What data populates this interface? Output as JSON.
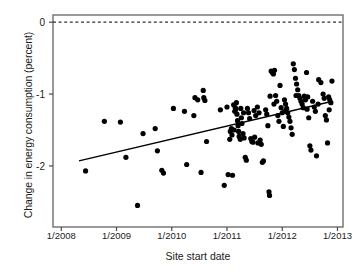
{
  "chart_data": {
    "type": "scatter",
    "title": "",
    "xlabel": "Site start date",
    "ylabel": "Change in energy consumption (percent)",
    "xtick_labels": [
      "1/2008",
      "1/2009",
      "1/2010",
      "1/2011",
      "1/2012",
      "1/2013"
    ],
    "xtick_values": [
      2008.0,
      2009.0,
      2010.0,
      2011.0,
      2012.0,
      2013.0
    ],
    "ytick_labels": [
      "0",
      "-1",
      "-2"
    ],
    "ytick_values": [
      0,
      -1,
      -2
    ],
    "xlim": [
      2007.85,
      2013.1
    ],
    "ylim": [
      -2.85,
      0.1
    ],
    "grid": false,
    "legend": null,
    "marker_color": "#000000",
    "marker_size_px": 4.6,
    "reference_line": {
      "y": 0,
      "style": "dashed",
      "color": "#333333"
    },
    "trendline": {
      "type": "linear-fit",
      "color": "#000000",
      "x_start": 2008.32,
      "y_start": -1.93,
      "x_end": 2012.91,
      "y_end": -1.1
    },
    "points": [
      [
        2008.44,
        -2.07
      ],
      [
        2008.78,
        -1.38
      ],
      [
        2009.07,
        -1.39
      ],
      [
        2009.17,
        -1.88
      ],
      [
        2009.38,
        -2.55
      ],
      [
        2009.48,
        -1.55
      ],
      [
        2009.7,
        -1.48
      ],
      [
        2009.74,
        -1.79
      ],
      [
        2009.82,
        -2.06
      ],
      [
        2009.85,
        -2.1
      ],
      [
        2010.03,
        -1.2
      ],
      [
        2010.23,
        -1.24
      ],
      [
        2010.27,
        -1.98
      ],
      [
        2010.4,
        -1.3
      ],
      [
        2010.42,
        -1.05
      ],
      [
        2010.47,
        -1.08
      ],
      [
        2010.53,
        -2.09
      ],
      [
        2010.57,
        -0.95
      ],
      [
        2010.58,
        -1.05
      ],
      [
        2010.6,
        -1.09
      ],
      [
        2010.63,
        -1.66
      ],
      [
        2010.88,
        -1.22
      ],
      [
        2010.95,
        -2.27
      ],
      [
        2011.0,
        -1.18
      ],
      [
        2011.02,
        -2.12
      ],
      [
        2011.06,
        -1.52
      ],
      [
        2011.08,
        -1.48
      ],
      [
        2011.1,
        -2.13
      ],
      [
        2011.12,
        -1.15
      ],
      [
        2011.14,
        -1.24
      ],
      [
        2011.15,
        -1.19
      ],
      [
        2011.16,
        -1.21
      ],
      [
        2011.17,
        -1.12
      ],
      [
        2011.18,
        -1.28
      ],
      [
        2011.19,
        -1.37
      ],
      [
        2011.2,
        -1.44
      ],
      [
        2011.21,
        -1.52
      ],
      [
        2011.22,
        -1.59
      ],
      [
        2011.24,
        -1.63
      ],
      [
        2011.26,
        -1.33
      ],
      [
        2011.27,
        -1.41
      ],
      [
        2011.29,
        -1.55
      ],
      [
        2011.31,
        -1.61
      ],
      [
        2011.33,
        -1.88
      ],
      [
        2011.35,
        -1.92
      ],
      [
        2011.37,
        -1.2
      ],
      [
        2011.39,
        -1.26
      ],
      [
        2011.41,
        -1.34
      ],
      [
        2011.43,
        -1.62
      ],
      [
        2011.45,
        -1.66
      ],
      [
        2011.47,
        -1.67
      ],
      [
        2011.49,
        -1.23
      ],
      [
        2011.52,
        -1.3
      ],
      [
        2011.55,
        -1.18
      ],
      [
        2011.58,
        -1.26
      ],
      [
        2011.6,
        -1.64
      ],
      [
        2011.62,
        -1.7
      ],
      [
        2011.64,
        -1.95
      ],
      [
        2011.66,
        -1.93
      ],
      [
        2011.7,
        -1.22
      ],
      [
        2011.72,
        -1.28
      ],
      [
        2011.74,
        -1.44
      ],
      [
        2011.76,
        -2.36
      ],
      [
        2011.77,
        -2.41
      ],
      [
        2011.8,
        -0.68
      ],
      [
        2011.82,
        -0.7
      ],
      [
        2011.84,
        -0.72
      ],
      [
        2011.86,
        -0.67
      ],
      [
        2011.88,
        -1.02
      ],
      [
        2011.9,
        -1.1
      ],
      [
        2011.92,
        -1.3
      ],
      [
        2011.94,
        -1.38
      ],
      [
        2011.96,
        -0.88
      ],
      [
        2011.98,
        -1.19
      ],
      [
        2012.0,
        -1.26
      ],
      [
        2012.02,
        -1.45
      ],
      [
        2012.04,
        -1.08
      ],
      [
        2012.06,
        -1.14
      ],
      [
        2012.08,
        -1.2
      ],
      [
        2012.1,
        -1.26
      ],
      [
        2012.12,
        -1.32
      ],
      [
        2012.14,
        -1.38
      ],
      [
        2012.16,
        -1.47
      ],
      [
        2012.18,
        -1.56
      ],
      [
        2012.2,
        -0.58
      ],
      [
        2012.22,
        -0.66
      ],
      [
        2012.24,
        -0.78
      ],
      [
        2012.26,
        -0.86
      ],
      [
        2012.28,
        -0.94
      ],
      [
        2012.3,
        -1.02
      ],
      [
        2012.32,
        -1.06
      ],
      [
        2012.34,
        -1.1
      ],
      [
        2012.36,
        -1.14
      ],
      [
        2012.38,
        -1.19
      ],
      [
        2012.4,
        -1.03
      ],
      [
        2012.42,
        -1.08
      ],
      [
        2012.44,
        -0.7
      ],
      [
        2012.46,
        -1.04
      ],
      [
        2012.48,
        -1.33
      ],
      [
        2012.5,
        -1.72
      ],
      [
        2012.52,
        -1.78
      ],
      [
        2012.55,
        -1.1
      ],
      [
        2012.58,
        -1.18
      ],
      [
        2012.6,
        -1.24
      ],
      [
        2012.62,
        -1.86
      ],
      [
        2012.66,
        -0.8
      ],
      [
        2012.7,
        -0.84
      ],
      [
        2012.74,
        -1.0
      ],
      [
        2012.76,
        -1.06
      ],
      [
        2012.78,
        -1.3
      ],
      [
        2012.8,
        -1.36
      ],
      [
        2012.82,
        -1.68
      ],
      [
        2012.84,
        -1.04
      ],
      [
        2012.86,
        -1.08
      ],
      [
        2012.88,
        -1.12
      ],
      [
        2012.9,
        -0.82
      ],
      [
        2011.05,
        -1.63
      ],
      [
        2011.09,
        -1.57
      ],
      [
        2011.13,
        -1.5
      ],
      [
        2011.25,
        -1.2
      ],
      [
        2011.3,
        -1.26
      ],
      [
        2011.5,
        -1.6
      ],
      [
        2011.56,
        -1.68
      ],
      [
        2011.78,
        -1.03
      ],
      [
        2011.85,
        -1.14
      ],
      [
        2012.05,
        -1.24
      ],
      [
        2012.25,
        -1.02
      ],
      [
        2012.45,
        -1.21
      ],
      [
        2012.65,
        -1.14
      ],
      [
        2012.85,
        -1.22
      ]
    ]
  }
}
